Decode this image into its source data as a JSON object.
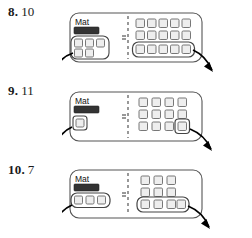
{
  "worksheet": {
    "problems": [
      {
        "number": "8.",
        "answer": "10",
        "mat_label": "Mat",
        "left_group": {
          "rows": [
            3,
            2
          ],
          "circled": true,
          "total": 5
        },
        "right_group": {
          "rows": [
            5,
            5,
            5
          ],
          "circled_row_index": 2,
          "total": 15
        },
        "divider": "dashed",
        "equals_sign": "=",
        "arrows": [
          "down-left",
          "down-right"
        ]
      },
      {
        "number": "9.",
        "answer": "11",
        "mat_label": "Mat",
        "left_group": {
          "rows": [
            1
          ],
          "circled": true,
          "total": 1
        },
        "right_group": {
          "rows": [
            4,
            4,
            4
          ],
          "circled_cell": "row3-col4",
          "total": 12
        },
        "divider": "dashed",
        "equals_sign": "=",
        "arrows": [
          "down-left",
          "down-right"
        ]
      },
      {
        "number": "10.",
        "answer": "7",
        "mat_label": "Mat",
        "left_group": {
          "rows": [
            3
          ],
          "circled": true,
          "total": 3
        },
        "right_group": {
          "rows": [
            3,
            3,
            3
          ],
          "circled_row_index": 2,
          "total": 9
        },
        "divider": "dashed",
        "equals_sign": "=",
        "arrows": [
          "down-left",
          "down-right"
        ]
      }
    ],
    "colors": {
      "ink": "#1a1a1a",
      "tile_fill": "#eeeeee",
      "tile_stroke": "#777777",
      "bar_fill": "#333333",
      "panel_stroke": "#555555",
      "arrow": "#000000"
    }
  }
}
